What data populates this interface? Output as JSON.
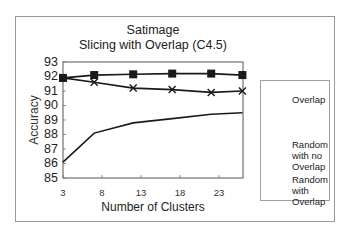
{
  "chart_data": {
    "type": "line",
    "title": "Satimage",
    "subtitle": "Slicing with Overlap (C4.5)",
    "xlabel": "Number of Clusters",
    "ylabel": "Accuracy",
    "x": [
      3,
      7,
      12,
      17,
      22,
      26
    ],
    "xticks": [
      3,
      8,
      13,
      18,
      23
    ],
    "yticks": [
      85,
      86,
      87,
      88,
      89,
      90,
      91,
      92,
      93
    ],
    "ylim": [
      85,
      93
    ],
    "xlim": [
      3,
      26
    ],
    "grid": false,
    "legend_position": "right",
    "series": [
      {
        "name": "Overlap",
        "marker": "none",
        "values": [
          86.1,
          88.1,
          88.8,
          89.1,
          89.4,
          89.5
        ]
      },
      {
        "name": "Random with no Overlap",
        "marker": "x",
        "values": [
          91.9,
          91.6,
          91.2,
          91.1,
          90.9,
          91.0
        ]
      },
      {
        "name": "Random with Overlap",
        "marker": "square",
        "values": [
          91.9,
          92.1,
          92.15,
          92.2,
          92.2,
          92.1
        ]
      }
    ]
  },
  "legend": {
    "items": [
      {
        "lines": [
          "Overlap"
        ]
      },
      {
        "lines": [
          "Random",
          "with no",
          "Overlap"
        ]
      },
      {
        "lines": [
          "Random",
          "with",
          "Overlap"
        ]
      }
    ]
  },
  "colors": {
    "line": "#1a1a1a",
    "frame": "#9a9a9a",
    "axis": "#555555"
  }
}
